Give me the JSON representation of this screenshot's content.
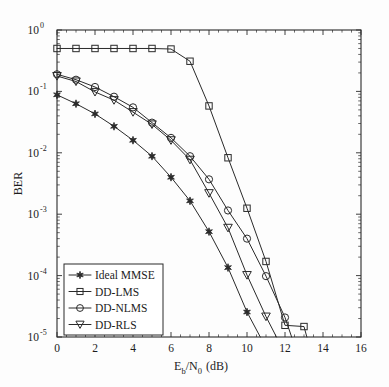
{
  "chart_data": {
    "type": "line",
    "title": "",
    "xlabel": "E_b/N_0 (dB)",
    "xlabel_parts": {
      "base1": "E",
      "sub1": "b",
      "slash": "/",
      "base2": "N",
      "sub2": "0",
      "unit": " (dB)"
    },
    "ylabel": "BER",
    "xlim": [
      0,
      16
    ],
    "ylim": [
      1e-05,
      1
    ],
    "yscale": "log",
    "xticks": [
      0,
      2,
      4,
      6,
      8,
      10,
      12,
      14,
      16
    ],
    "xtick_labels": [
      "0",
      "2",
      "4",
      "6",
      "8",
      "10",
      "12",
      "14",
      "16"
    ],
    "yticks": [
      1,
      0.1,
      0.01,
      0.001,
      0.0001,
      1e-05
    ],
    "ytick_labels": [
      "10",
      "10",
      "10",
      "10",
      "10",
      "10"
    ],
    "ytick_exponents": [
      "0",
      "-1",
      "-2",
      "-3",
      "-4",
      "-5"
    ],
    "grid": false,
    "legend_position": "lower left",
    "series": [
      {
        "name": "Ideal MMSE",
        "marker": "star-filled",
        "x": [
          0,
          1,
          2,
          3,
          4,
          5,
          6,
          7,
          8,
          9,
          10,
          10.7
        ],
        "y": [
          0.088,
          0.063,
          0.043,
          0.027,
          0.016,
          0.0088,
          0.004,
          0.00165,
          0.00052,
          0.000135,
          2.55e-05,
          1e-05
        ]
      },
      {
        "name": "DD-LMS",
        "marker": "square",
        "x": [
          0,
          1,
          2,
          3,
          4,
          5,
          6,
          7,
          8,
          9,
          10,
          11,
          12,
          13,
          13.15
        ],
        "y": [
          0.5,
          0.5,
          0.5,
          0.5,
          0.5,
          0.5,
          0.49,
          0.31,
          0.058,
          0.0083,
          0.00125,
          0.00017,
          1.55e-05,
          1.48e-05,
          1e-05
        ]
      },
      {
        "name": "DD-NLMS",
        "marker": "circle",
        "x": [
          0,
          1,
          2,
          3,
          4,
          5,
          6,
          7,
          8,
          9,
          10,
          11,
          12,
          12.35
        ],
        "y": [
          0.19,
          0.155,
          0.118,
          0.082,
          0.055,
          0.031,
          0.0175,
          0.0088,
          0.0037,
          0.00115,
          0.0004,
          9.8e-05,
          2.08e-05,
          1e-05
        ]
      },
      {
        "name": "DD-RLS",
        "marker": "triangle-down",
        "x": [
          0,
          1,
          2,
          3,
          4,
          5,
          6,
          7,
          8,
          9,
          10,
          11,
          11.55
        ],
        "y": [
          0.178,
          0.145,
          0.098,
          0.072,
          0.046,
          0.029,
          0.016,
          0.0077,
          0.0022,
          0.0006,
          0.000102,
          2.15e-05,
          1e-05
        ]
      }
    ]
  },
  "legend": {
    "entries": [
      {
        "label": "Ideal MMSE",
        "marker": "star-filled"
      },
      {
        "label": "DD-LMS",
        "marker": "square"
      },
      {
        "label": "DD-NLMS",
        "marker": "circle"
      },
      {
        "label": "DD-RLS",
        "marker": "triangle-down"
      }
    ]
  },
  "colors": {
    "line": "#2a2a2a",
    "axis": "#2b2b2b",
    "background": "#fdfdfd"
  }
}
